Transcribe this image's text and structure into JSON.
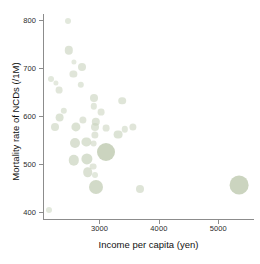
{
  "chart_data": {
    "type": "scatter",
    "title": "",
    "xlabel": "Income per capita (yen)",
    "ylabel": "Mortality rate of NCDs (/1M)",
    "xlim": [
      2050,
      5600
    ],
    "ylim": [
      385,
      812
    ],
    "xticks": [
      3000,
      4000,
      5000
    ],
    "xtick_labels": [
      "3000",
      "4000",
      "5000"
    ],
    "yticks": [
      400,
      500,
      600,
      700,
      800
    ],
    "ytick_labels": [
      "400",
      "500",
      "600",
      "700",
      "800"
    ],
    "grid": false,
    "legend": null,
    "marker_color": "#c8d2bc",
    "marker_shape": "circle",
    "size_encodes": "population",
    "points": [
      {
        "x": 2470,
        "y": 797,
        "size": 3.0
      },
      {
        "x": 2480,
        "y": 736,
        "size": 4.2
      },
      {
        "x": 2570,
        "y": 712,
        "size": 2.6
      },
      {
        "x": 2700,
        "y": 701,
        "size": 4.0
      },
      {
        "x": 2560,
        "y": 688,
        "size": 3.6
      },
      {
        "x": 2180,
        "y": 676,
        "size": 3.0
      },
      {
        "x": 2270,
        "y": 668,
        "size": 2.6
      },
      {
        "x": 2690,
        "y": 664,
        "size": 3.2
      },
      {
        "x": 2320,
        "y": 654,
        "size": 3.4
      },
      {
        "x": 2900,
        "y": 637,
        "size": 4.0
      },
      {
        "x": 3380,
        "y": 631,
        "size": 3.8
      },
      {
        "x": 2900,
        "y": 620,
        "size": 3.2
      },
      {
        "x": 2400,
        "y": 610,
        "size": 3.2
      },
      {
        "x": 3030,
        "y": 607,
        "size": 3.4
      },
      {
        "x": 2330,
        "y": 596,
        "size": 4.4
      },
      {
        "x": 2720,
        "y": 592,
        "size": 3.6
      },
      {
        "x": 2940,
        "y": 588,
        "size": 4.2
      },
      {
        "x": 2250,
        "y": 577,
        "size": 4.0
      },
      {
        "x": 2610,
        "y": 577,
        "size": 4.6
      },
      {
        "x": 2930,
        "y": 576,
        "size": 4.0
      },
      {
        "x": 3110,
        "y": 574,
        "size": 3.4
      },
      {
        "x": 3560,
        "y": 577,
        "size": 3.6
      },
      {
        "x": 3430,
        "y": 572,
        "size": 3.2
      },
      {
        "x": 2920,
        "y": 560,
        "size": 3.6
      },
      {
        "x": 3320,
        "y": 561,
        "size": 4.4
      },
      {
        "x": 2580,
        "y": 543,
        "size": 5.0
      },
      {
        "x": 2780,
        "y": 545,
        "size": 4.6
      },
      {
        "x": 2900,
        "y": 542,
        "size": 3.4
      },
      {
        "x": 3110,
        "y": 525,
        "size": 9.0
      },
      {
        "x": 2570,
        "y": 507,
        "size": 5.2
      },
      {
        "x": 2790,
        "y": 510,
        "size": 5.6
      },
      {
        "x": 2890,
        "y": 494,
        "size": 3.4
      },
      {
        "x": 2800,
        "y": 482,
        "size": 4.8
      },
      {
        "x": 2930,
        "y": 477,
        "size": 3.0
      },
      {
        "x": 2950,
        "y": 452,
        "size": 7.0
      },
      {
        "x": 3680,
        "y": 447,
        "size": 4.0
      },
      {
        "x": 5350,
        "y": 455,
        "size": 9.4
      },
      {
        "x": 2150,
        "y": 403,
        "size": 3.0
      }
    ]
  }
}
